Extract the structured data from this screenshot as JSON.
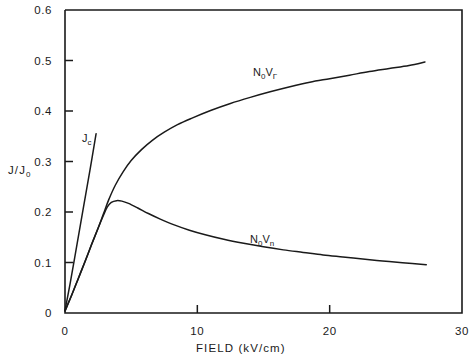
{
  "figure": {
    "background_color": "#ffffff",
    "ink_color": "#1a1a1a"
  },
  "axes": {
    "x_title": "FIELD  (kV/cm)",
    "y_title_main": "J/J",
    "y_title_sub": "0",
    "x_tick_labels": [
      "0",
      "10",
      "20",
      "30"
    ],
    "y_tick_labels": [
      "0",
      "0.1",
      "0.2",
      "0.3",
      "0.4",
      "0.5",
      "0.6"
    ]
  },
  "annotations": {
    "jc": {
      "main": "J",
      "sub": "c"
    },
    "gamma_curve": {
      "n": "N",
      "n_sub": "0",
      "v": "V",
      "v_sub": "Γ"
    },
    "n_curve": {
      "n": "N",
      "n_sub": "0",
      "v": "V",
      "v_sub": "n"
    }
  },
  "chart_data": {
    "type": "line",
    "title": "",
    "xlabel": "FIELD  (kV/cm)",
    "ylabel": "J/J0",
    "xlim": [
      0,
      30
    ],
    "ylim": [
      0,
      0.6
    ],
    "xticks": [
      0,
      10,
      20,
      30
    ],
    "yticks": [
      0,
      0.1,
      0.2,
      0.3,
      0.4,
      0.5,
      0.6
    ],
    "grid": false,
    "legend": "inline-annotations",
    "series": [
      {
        "name": "Jc",
        "label": "J_c",
        "label_position": [
          2.9,
          0.335
        ],
        "points": [
          [
            0.0,
            0.005
          ],
          [
            0.4,
            0.06
          ],
          [
            0.9,
            0.135
          ],
          [
            1.4,
            0.21
          ],
          [
            1.9,
            0.285
          ],
          [
            2.35,
            0.355
          ]
        ]
      },
      {
        "name": "N0 V_Gamma",
        "label": "N_0 V_Γ",
        "label_position": [
          14.7,
          0.425
        ],
        "points": [
          [
            0.0,
            0.004
          ],
          [
            0.5,
            0.035
          ],
          [
            1.0,
            0.068
          ],
          [
            1.5,
            0.101
          ],
          [
            2.0,
            0.135
          ],
          [
            2.5,
            0.168
          ],
          [
            2.9,
            0.196
          ],
          [
            3.3,
            0.224
          ],
          [
            3.8,
            0.253
          ],
          [
            4.4,
            0.28
          ],
          [
            5.0,
            0.302
          ],
          [
            5.8,
            0.324
          ],
          [
            6.6,
            0.342
          ],
          [
            7.5,
            0.358
          ],
          [
            8.5,
            0.373
          ],
          [
            9.6,
            0.386
          ],
          [
            11.0,
            0.401
          ],
          [
            12.5,
            0.415
          ],
          [
            14.0,
            0.427
          ],
          [
            15.5,
            0.438
          ],
          [
            17.0,
            0.448
          ],
          [
            18.5,
            0.457
          ],
          [
            20.0,
            0.464
          ],
          [
            21.5,
            0.471
          ],
          [
            23.0,
            0.478
          ],
          [
            24.5,
            0.484
          ],
          [
            26.0,
            0.49
          ],
          [
            27.2,
            0.497
          ]
        ]
      },
      {
        "name": "N0 V_n",
        "label": "N_0 V_n",
        "label_position": [
          15.0,
          0.165
        ],
        "points": [
          [
            0.0,
            0.004
          ],
          [
            0.5,
            0.035
          ],
          [
            1.0,
            0.068
          ],
          [
            1.5,
            0.101
          ],
          [
            2.0,
            0.135
          ],
          [
            2.5,
            0.168
          ],
          [
            2.9,
            0.193
          ],
          [
            3.2,
            0.21
          ],
          [
            3.5,
            0.219
          ],
          [
            3.9,
            0.2225
          ],
          [
            4.3,
            0.2215
          ],
          [
            4.8,
            0.217
          ],
          [
            5.5,
            0.208
          ],
          [
            6.3,
            0.197
          ],
          [
            7.2,
            0.186
          ],
          [
            8.2,
            0.175
          ],
          [
            9.4,
            0.164
          ],
          [
            10.6,
            0.155
          ],
          [
            12.0,
            0.146
          ],
          [
            13.5,
            0.138
          ],
          [
            15.0,
            0.131
          ],
          [
            16.5,
            0.125
          ],
          [
            18.0,
            0.12
          ],
          [
            19.5,
            0.115
          ],
          [
            21.0,
            0.111
          ],
          [
            22.5,
            0.107
          ],
          [
            24.0,
            0.103
          ],
          [
            25.5,
            0.0995
          ],
          [
            27.3,
            0.0955
          ]
        ]
      }
    ]
  }
}
